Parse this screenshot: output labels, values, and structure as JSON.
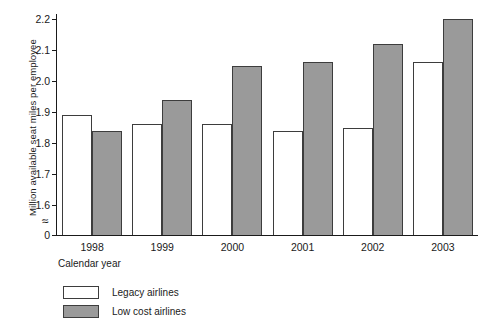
{
  "chart_data": {
    "type": "bar",
    "title": "",
    "xlabel": "Calendar year",
    "ylabel": "Million available seat miles per employee",
    "categories": [
      "1998",
      "1999",
      "2000",
      "2001",
      "2002",
      "2003"
    ],
    "series": [
      {
        "name": "Legacy airlines",
        "color": "#ffffff",
        "values": [
          1.89,
          1.86,
          1.86,
          1.84,
          1.85,
          2.06
        ]
      },
      {
        "name": "Low cost airlines",
        "color": "#9a9a9a",
        "values": [
          1.84,
          1.94,
          2.05,
          2.06,
          2.12,
          2.2
        ]
      }
    ],
    "ylim": [
      1.6,
      2.2
    ],
    "yticks": [
      "0",
      "1.6",
      "1.7",
      "1.8",
      "1.9",
      "2.0",
      "2.1",
      "2.2"
    ],
    "y_axis_break": "≈",
    "y_axis_break_note": "axis break between 0 and 1.6",
    "grid": false,
    "legend_position": "below-left"
  },
  "axis": {
    "y_title": "Million available seat miles per employee",
    "x_title": "Calendar year",
    "ticks": [
      {
        "label": "2.2",
        "value": 2.2
      },
      {
        "label": "2.1",
        "value": 2.1
      },
      {
        "label": "2.0",
        "value": 2.0
      },
      {
        "label": "1.9",
        "value": 1.9
      },
      {
        "label": "1.8",
        "value": 1.8
      },
      {
        "label": "1.7",
        "value": 1.7
      },
      {
        "label": "1.6",
        "value": 1.6
      },
      {
        "label": "0",
        "value": 0
      }
    ],
    "break_glyph": "≈"
  },
  "groups": [
    {
      "year": "1998",
      "legacy": 1.89,
      "lowcost": 1.84
    },
    {
      "year": "1999",
      "legacy": 1.86,
      "lowcost": 1.94
    },
    {
      "year": "2000",
      "legacy": 1.86,
      "lowcost": 2.05
    },
    {
      "year": "2001",
      "legacy": 1.84,
      "lowcost": 2.06
    },
    {
      "year": "2002",
      "legacy": 1.85,
      "lowcost": 2.12
    },
    {
      "year": "2003",
      "legacy": 2.06,
      "lowcost": 2.2
    }
  ],
  "legend": {
    "items": [
      {
        "label": "Legacy airlines",
        "style": "legacy"
      },
      {
        "label": "Low cost airlines",
        "style": "lowcost"
      }
    ]
  }
}
